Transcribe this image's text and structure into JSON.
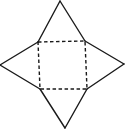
{
  "diagram": {
    "kind": "square-pyramid-net",
    "stroke_color": "#1a1a1a",
    "background": "#ffffff",
    "base_square": {
      "style": "dashed",
      "corners": [
        [
          38,
          42
        ],
        [
          85,
          41
        ],
        [
          87,
          89
        ],
        [
          40,
          89
        ]
      ]
    },
    "triangles": [
      {
        "name": "top",
        "apex": [
          60,
          1
        ],
        "base": [
          [
            38,
            42
          ],
          [
            85,
            41
          ]
        ]
      },
      {
        "name": "right",
        "apex": [
          124,
          64
        ],
        "base": [
          [
            85,
            41
          ],
          [
            87,
            89
          ]
        ]
      },
      {
        "name": "bottom",
        "apex": [
          65,
          128
        ],
        "base": [
          [
            87,
            89
          ],
          [
            40,
            89
          ]
        ]
      },
      {
        "name": "left",
        "apex": [
          0,
          65
        ],
        "base": [
          [
            40,
            89
          ],
          [
            38,
            42
          ]
        ]
      }
    ]
  }
}
